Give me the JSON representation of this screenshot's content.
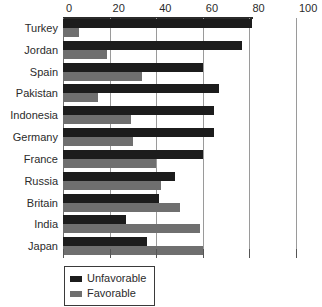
{
  "chart_data": {
    "type": "bar",
    "orientation": "horizontal",
    "title": "",
    "subtitle": "",
    "xlabel": "",
    "ylabel": "",
    "xlim": [
      0,
      100
    ],
    "xticks": [
      0,
      20,
      40,
      60,
      80,
      100
    ],
    "xtick_labels": [
      "0",
      "20",
      "40",
      "60",
      "80",
      "100"
    ],
    "grid": true,
    "legend_position": "bottom-left",
    "categories": [
      "Turkey",
      "Jordan",
      "Spain",
      "Pakistan",
      "Indonesia",
      "Germany",
      "France",
      "Russia",
      "Britain",
      "India",
      "Japan"
    ],
    "series": [
      {
        "name": "Unfavorable",
        "color": "#1c1c1c",
        "values": [
          81,
          77,
          60,
          67,
          65,
          65,
          60,
          48,
          41,
          27,
          36
        ]
      },
      {
        "name": "Favorable",
        "color": "#6f6f6f",
        "values": [
          7,
          19,
          34,
          15,
          29,
          30,
          40,
          42,
          50,
          59,
          60
        ]
      }
    ]
  },
  "legend": {
    "entries": [
      {
        "label": "Unfavorable",
        "swatch": "unfavorable"
      },
      {
        "label": "Favorable",
        "swatch": "favorable"
      }
    ]
  }
}
